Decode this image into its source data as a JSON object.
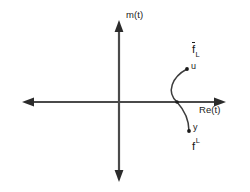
{
  "figure": {
    "background_color": "#ffffff",
    "line_color": "#4a4a4a",
    "text_color": "#1a1a1a",
    "width": 250,
    "height": 192
  },
  "axes": {
    "vertical": {
      "name": "imaginary-axis",
      "label": "Im(t)",
      "label_prefix": "I",
      "label_suffix": "m(t)",
      "arrow_direction": "both",
      "x": 119,
      "y_top": 20,
      "y_bottom": 182
    },
    "horizontal": {
      "name": "real-axis",
      "label": "Re(t)",
      "arrow_direction": "both",
      "y": 102,
      "x_left": 22,
      "x_right": 226
    },
    "origin": {
      "x": 119,
      "y": 102
    }
  },
  "curve": {
    "name": "arc-path",
    "description": "arc bulging left crossing the real axis",
    "start_point": {
      "label": "u",
      "x": 187,
      "y": 69
    },
    "crossing_point": {
      "label": "",
      "x": 177,
      "y": 102
    },
    "end_point": {
      "label": "y",
      "x": 189,
      "y": 131
    },
    "control_left_x": 166
  },
  "labels": {
    "upper_curve": {
      "base": "f",
      "subscript": "L",
      "overline": true,
      "text": "f̄L"
    },
    "lower_curve": {
      "base": "f",
      "superscript": "L",
      "overline": false,
      "text": "fL"
    },
    "point_u": "u",
    "point_y": "y"
  }
}
